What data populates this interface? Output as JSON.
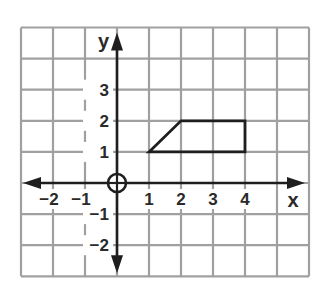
{
  "diagram": {
    "type": "coordinate-grid",
    "title": "",
    "grid": {
      "x_min": -3,
      "x_max": 6,
      "y_min": -3,
      "y_max": 5,
      "cell_px_x": 32,
      "cell_px_y": 31.1,
      "origin_px": [
        117,
        183
      ],
      "grid_color": "#a0a0a0",
      "axis_color": "#1e1e1e"
    },
    "axes": {
      "x_label": "x",
      "y_label": "y",
      "x_ticks": [
        {
          "value": -2,
          "label": "−2"
        },
        {
          "value": -1,
          "label": "−1"
        },
        {
          "value": 1,
          "label": "1"
        },
        {
          "value": 2,
          "label": "2"
        },
        {
          "value": 3,
          "label": "3"
        },
        {
          "value": 4,
          "label": "4"
        }
      ],
      "y_ticks": [
        {
          "value": 3,
          "label": "3"
        },
        {
          "value": 2,
          "label": "2"
        },
        {
          "value": 1,
          "label": "1"
        },
        {
          "value": -1,
          "label": "−1"
        },
        {
          "value": -2,
          "label": "−2"
        }
      ],
      "origin_marker": "circle-cross"
    },
    "shapes": [
      {
        "name": "trapezoid",
        "vertices": [
          [
            1,
            1
          ],
          [
            2,
            2
          ],
          [
            4,
            2
          ],
          [
            4,
            1
          ]
        ],
        "stroke": "#1e1e1e",
        "fill": "none"
      }
    ]
  }
}
